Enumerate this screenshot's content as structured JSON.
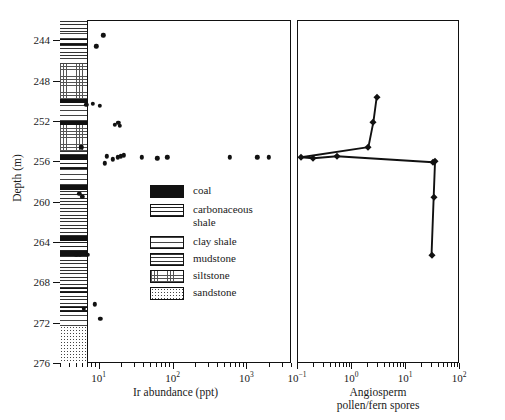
{
  "figure": {
    "domain": "scientific-figure"
  },
  "axes": {
    "depth": {
      "title": "Depth (m)",
      "ticks": [
        244,
        248,
        252,
        256,
        260,
        264,
        268,
        272,
        276
      ],
      "min": 242.0,
      "max": 276.0,
      "direction": "inverted"
    },
    "ir": {
      "title": "Ir abundance (ppt)",
      "tick_labels": [
        "10",
        "10",
        "10"
      ],
      "tick_exponents": [
        "1",
        "2",
        "3"
      ],
      "tick_values": [
        10,
        100,
        1000
      ],
      "min": 3,
      "max": 4000,
      "scale": "log"
    },
    "pollen": {
      "title_line1": "Angiosperm",
      "title_line2": "pollen/fern spores",
      "tick_labels": [
        "10",
        "10",
        "10",
        "10"
      ],
      "tick_exponents": [
        "−1",
        "0",
        "1",
        "2"
      ],
      "tick_values": [
        0.1,
        1,
        10,
        100
      ],
      "min": 0.1,
      "max": 100,
      "scale": "log"
    }
  },
  "legend": {
    "items": [
      {
        "label": "coal",
        "pattern": "coal",
        "swatch_class": "sw-coal"
      },
      {
        "label": "carbonaceous shale",
        "pattern": "carbonaceous-shale",
        "swatch_class": "sw-carb"
      },
      {
        "label": "clay shale",
        "pattern": "clay-shale",
        "swatch_class": "sw-clay"
      },
      {
        "label": "mudstone",
        "pattern": "mudstone",
        "swatch_class": "sw-mud"
      },
      {
        "label": "siltstone",
        "pattern": "siltstone",
        "swatch_class": "sw-silt"
      },
      {
        "label": "sandstone",
        "pattern": "sandstone",
        "swatch_class": "sw-sand"
      }
    ]
  },
  "chart_data": {
    "type": "scatter",
    "title": "",
    "panels": [
      {
        "name": "ir-abundance",
        "type": "scatter",
        "xlabel": "Ir abundance (ppt)",
        "ylabel": "Depth (m)",
        "xscale": "log",
        "yscale": "linear",
        "xlim": [
          3,
          4000
        ],
        "ylim": [
          276,
          242
        ],
        "grid": false,
        "points": [
          {
            "ir": 11.5,
            "depth": 243.5
          },
          {
            "ir": 9.3,
            "depth": 244.6
          },
          {
            "ir": 6.8,
            "depth": 250.4
          },
          {
            "ir": 8.3,
            "depth": 250.3
          },
          {
            "ir": 10.3,
            "depth": 250.5
          },
          {
            "ir": 16.5,
            "depth": 252.4
          },
          {
            "ir": 18.5,
            "depth": 252.2
          },
          {
            "ir": 19.5,
            "depth": 252.5
          },
          {
            "ir": 5.8,
            "depth": 254.6
          },
          {
            "ir": 12.0,
            "depth": 256.2
          },
          {
            "ir": 12.8,
            "depth": 255.5
          },
          {
            "ir": 15.5,
            "depth": 255.8
          },
          {
            "ir": 18.0,
            "depth": 255.6
          },
          {
            "ir": 20.0,
            "depth": 255.5
          },
          {
            "ir": 22.0,
            "depth": 255.4
          },
          {
            "ir": 38.0,
            "depth": 255.6
          },
          {
            "ir": 62.0,
            "depth": 255.7
          },
          {
            "ir": 85.0,
            "depth": 255.6
          },
          {
            "ir": 600.0,
            "depth": 255.6
          },
          {
            "ir": 1400.0,
            "depth": 255.6
          },
          {
            "ir": 2000.0,
            "depth": 255.6
          },
          {
            "ir": 5.5,
            "depth": 259.2
          },
          {
            "ir": 6.0,
            "depth": 259.5
          },
          {
            "ir": 6.4,
            "depth": 263.7
          },
          {
            "ir": 5.0,
            "depth": 265.3
          },
          {
            "ir": 5.6,
            "depth": 265.3
          },
          {
            "ir": 7.2,
            "depth": 265.3
          },
          {
            "ir": 8.8,
            "depth": 270.2
          },
          {
            "ir": 6.3,
            "depth": 270.6
          },
          {
            "ir": 10.5,
            "depth": 271.6
          }
        ]
      },
      {
        "name": "angiosperm-pollen-fern-spores",
        "type": "line",
        "xlabel": "Angiosperm pollen/fern spores",
        "ylabel": "Depth (m)",
        "xscale": "log",
        "yscale": "linear",
        "xlim": [
          0.1,
          100
        ],
        "ylim": [
          276,
          242
        ],
        "grid": false,
        "series": [
          {
            "name": "angiosperm/fern ratio",
            "points": [
              {
                "ratio": 3.0,
                "depth": 249.6
              },
              {
                "ratio": 2.6,
                "depth": 252.1
              },
              {
                "ratio": 2.1,
                "depth": 254.6
              },
              {
                "ratio": 0.12,
                "depth": 255.6
              },
              {
                "ratio": 0.2,
                "depth": 255.7
              },
              {
                "ratio": 0.55,
                "depth": 255.5
              },
              {
                "ratio": 33.0,
                "depth": 256.1
              },
              {
                "ratio": 36.0,
                "depth": 256.0
              },
              {
                "ratio": 34.0,
                "depth": 259.5
              },
              {
                "ratio": 31.0,
                "depth": 265.3
              }
            ]
          }
        ]
      }
    ]
  },
  "lithology": {
    "column_name": "stratigraphic-column",
    "beds": [
      {
        "top": 242.0,
        "base": 243.2,
        "type": "mudstone",
        "class": "lith-mud"
      },
      {
        "top": 243.2,
        "base": 243.9,
        "type": "clay-shale",
        "class": "lith-clay"
      },
      {
        "top": 243.9,
        "base": 244.5,
        "type": "carbonaceous-shale",
        "class": "lith-carb"
      },
      {
        "top": 244.5,
        "base": 245.6,
        "type": "mudstone",
        "class": "lith-mud"
      },
      {
        "top": 245.6,
        "base": 246.4,
        "type": "clay-shale",
        "class": "lith-clay"
      },
      {
        "top": 246.4,
        "base": 249.8,
        "type": "siltstone",
        "class": "lith-silt"
      },
      {
        "top": 249.8,
        "base": 250.2,
        "type": "coal",
        "class": "lith-coal"
      },
      {
        "top": 250.2,
        "base": 252.0,
        "type": "clay-shale",
        "class": "lith-clay"
      },
      {
        "top": 252.0,
        "base": 252.4,
        "type": "coal",
        "class": "lith-coal"
      },
      {
        "top": 252.4,
        "base": 255.0,
        "type": "siltstone",
        "class": "lith-silt"
      },
      {
        "top": 255.0,
        "base": 255.4,
        "type": "mudstone",
        "class": "lith-mud"
      },
      {
        "top": 255.4,
        "base": 255.8,
        "type": "coal",
        "class": "lith-coal"
      },
      {
        "top": 255.8,
        "base": 256.8,
        "type": "carbonaceous-shale",
        "class": "lith-carb"
      },
      {
        "top": 256.8,
        "base": 258.4,
        "type": "clay-shale",
        "class": "lith-clay"
      },
      {
        "top": 258.4,
        "base": 258.9,
        "type": "coal",
        "class": "lith-coal"
      },
      {
        "top": 258.9,
        "base": 263.4,
        "type": "mudstone",
        "class": "lith-mud"
      },
      {
        "top": 263.4,
        "base": 263.8,
        "type": "coal",
        "class": "lith-coal"
      },
      {
        "top": 263.8,
        "base": 265.0,
        "type": "carbonaceous-shale",
        "class": "lith-carb"
      },
      {
        "top": 265.0,
        "base": 265.4,
        "type": "coal",
        "class": "lith-coal"
      },
      {
        "top": 265.4,
        "base": 268.6,
        "type": "mudstone",
        "class": "lith-mud"
      },
      {
        "top": 268.6,
        "base": 269.1,
        "type": "carbonaceous-shale",
        "class": "lith-carb"
      },
      {
        "top": 269.1,
        "base": 270.4,
        "type": "mudstone",
        "class": "lith-mud"
      },
      {
        "top": 270.4,
        "base": 270.9,
        "type": "carbonaceous-shale",
        "class": "lith-carb"
      },
      {
        "top": 270.9,
        "base": 272.3,
        "type": "clay-shale",
        "class": "lith-clay"
      },
      {
        "top": 272.3,
        "base": 276.0,
        "type": "sandstone",
        "class": "lith-sand"
      }
    ]
  }
}
